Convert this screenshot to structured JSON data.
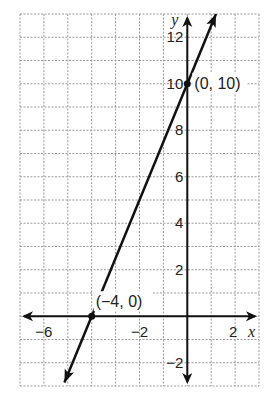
{
  "chart_data": {
    "type": "line",
    "title": "",
    "xlabel": "x",
    "ylabel": "y",
    "xlim": [
      -7,
      3
    ],
    "ylim": [
      -3,
      13
    ],
    "grid": true,
    "grid_style": "dashed",
    "x_ticks": [
      {
        "value": -6,
        "label": "−6"
      },
      {
        "value": -2,
        "label": "−2"
      },
      {
        "value": 2,
        "label": "2"
      }
    ],
    "y_ticks": [
      {
        "value": 12,
        "label": "12"
      },
      {
        "value": 10,
        "label": "10"
      },
      {
        "value": 8,
        "label": "8"
      },
      {
        "value": 6,
        "label": "6"
      },
      {
        "value": 4,
        "label": "4"
      },
      {
        "value": 2,
        "label": "2"
      },
      {
        "value": -2,
        "label": "−2"
      }
    ],
    "series": [
      {
        "name": "line",
        "equation": "y = 2.5x + 10",
        "x": [
          -4,
          0
        ],
        "y": [
          0,
          10
        ],
        "arrows": "both"
      }
    ],
    "annotations": [
      {
        "x": -4,
        "y": 0,
        "label": "(−4, 0)"
      },
      {
        "x": 0,
        "y": 10,
        "label": "(0, 10)"
      }
    ]
  },
  "colors": {
    "line": "#111111",
    "axis": "#111111",
    "grid": "#9a9a9a",
    "background": "#ffffff"
  }
}
